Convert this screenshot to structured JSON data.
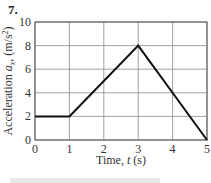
{
  "figure_number": "7.",
  "chart_data": {
    "type": "line",
    "title": "",
    "xlabel": "Time, t (s)",
    "xlabel_parts": [
      "Time, ",
      "t",
      " (s)"
    ],
    "ylabel": "Acceleration a_x (m/s^2)",
    "ylabel_parts": {
      "main": "Acceleration ",
      "var": "a",
      "sub": "x",
      "unit_pre": ", (m/s",
      "sup": "2",
      "unit_post": ")"
    },
    "xlim": [
      0,
      5
    ],
    "ylim": [
      0,
      10
    ],
    "x_ticks": [
      0,
      1,
      2,
      3,
      4,
      5
    ],
    "y_ticks": [
      0,
      2,
      4,
      6,
      8,
      10
    ],
    "x_tick_labels": [
      "0",
      "1",
      "2",
      "3",
      "4",
      "5"
    ],
    "y_tick_labels": [
      "0",
      "2",
      "4",
      "6",
      "8",
      "10"
    ],
    "grid": true,
    "series": [
      {
        "name": "acceleration",
        "x": [
          0,
          1,
          3,
          5
        ],
        "y": [
          2,
          2,
          8,
          0
        ],
        "color": "#111111"
      }
    ]
  }
}
